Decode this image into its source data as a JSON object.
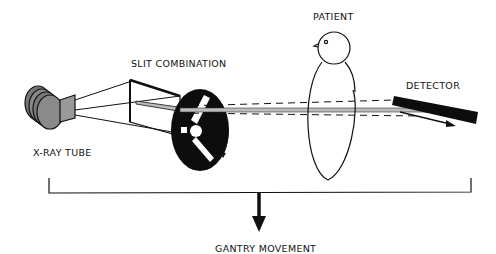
{
  "labels": {
    "slit": "SLIT COMBINATION",
    "patient": "PATIENT",
    "detector": "DETECTOR",
    "tube": "X-RAY TUBE",
    "gantry": "GANTRY MOVEMENT"
  },
  "colors": {
    "ink": "#111111",
    "background": "#ffffff",
    "beam": "#bdbdbd"
  }
}
